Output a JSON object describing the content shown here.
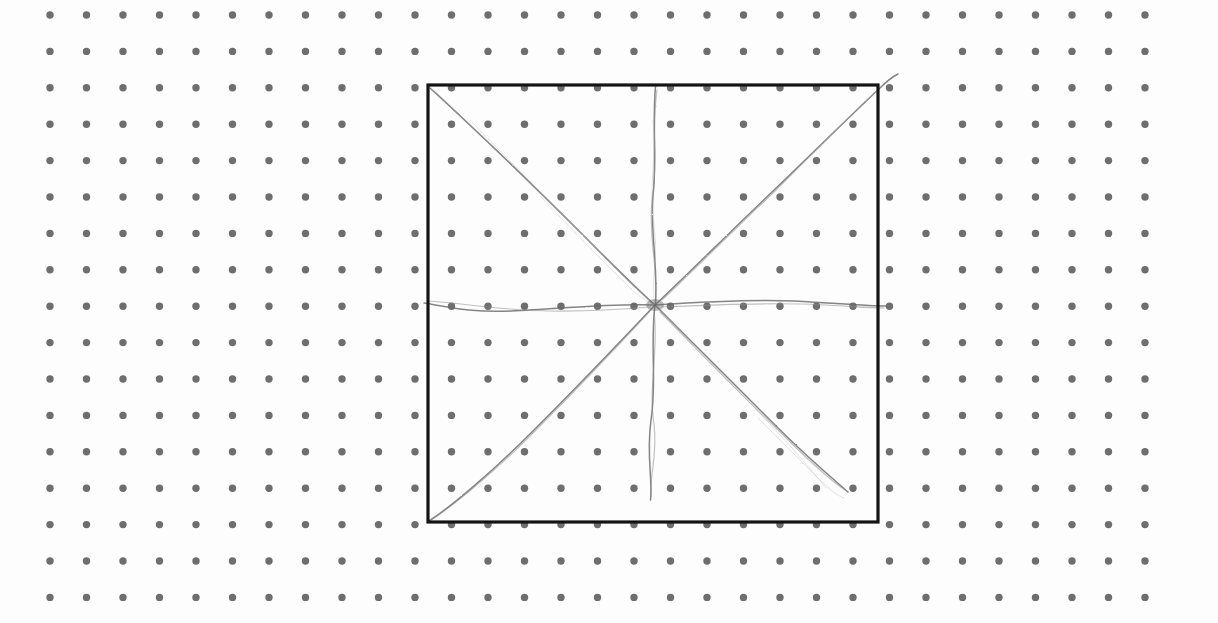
{
  "canvas": {
    "width": 1218,
    "height": 623,
    "background_color": "#fdfdfd",
    "description": "Hand-drawn radial starburst sketch on a dotted grid paper background enclosed by a black square frame"
  },
  "dot_grid": {
    "name": "dotted-grid-paper",
    "dot_color": "#6e6e6e",
    "dot_radius": 3.7,
    "origin_x": 50,
    "origin_y": 15,
    "spacing_x": 36.5,
    "spacing_y": 36.4,
    "columns": 31,
    "rows": 17
  },
  "frame": {
    "name": "square-frame",
    "stroke_color": "#141414",
    "stroke_width": 3.2,
    "left": 428,
    "top": 85,
    "right": 878,
    "bottom": 522,
    "width": 450,
    "height": 437
  },
  "sketch": {
    "name": "radial-starburst",
    "center_x": 655,
    "center_y": 305,
    "stroke_color": "#8c8c8c",
    "stroke_color_light": "#b4b4b4",
    "stroke_color_dark": "#6a6a6a",
    "ray_count": 8,
    "rays": [
      {
        "name": "ray-up",
        "direction": "up",
        "angle_deg": 270,
        "end_x": 655,
        "end_y": 86,
        "reaches_edge": true,
        "overshoot": false,
        "passes": 3,
        "paths": [
          "M655.5 86 C 652 130, 657 160, 653 196 C 650 232, 658 262, 655.5 305",
          "M657 90 C 651 132, 659 158, 652 200 C 648 240, 659 268, 655 305",
          "M653 120 C 657 156, 648 188, 654 226 C 659 262, 650 280, 655 304"
        ]
      },
      {
        "name": "ray-down",
        "direction": "down",
        "angle_deg": 90,
        "end_x": 651,
        "end_y": 500,
        "reaches_edge": false,
        "overshoot": false,
        "passes": 2,
        "paths": [
          "M655 305 C 650 345, 657 382, 651 420 C 646 456, 653 480, 650.5 500",
          "M654 312 C 659 350, 648 388, 654 424 C 658 454, 649 478, 651 496"
        ]
      },
      {
        "name": "ray-left",
        "direction": "left",
        "angle_deg": 180,
        "end_x": 424,
        "end_y": 303,
        "reaches_edge": true,
        "overshoot": true,
        "passes": 2,
        "paths": [
          "M655 305 C 610 303, 560 309, 512 311 C 470 313, 444 306, 424 303",
          "M650 307 C 604 311, 556 313, 510 309 C 474 306, 448 302, 428 301"
        ]
      },
      {
        "name": "ray-right",
        "direction": "right",
        "angle_deg": 0,
        "end_x": 886,
        "end_y": 306,
        "reaches_edge": true,
        "overshoot": true,
        "passes": 2,
        "paths": [
          "M655 305 C 700 302, 748 299, 794 301 C 836 303, 864 306, 886 306",
          "M662 307 C 706 305, 752 303, 800 304 C 840 305, 866 308, 884 308"
        ]
      },
      {
        "name": "ray-up-left",
        "direction": "up-left",
        "angle_deg": 225,
        "end_x": 430,
        "end_y": 88,
        "reaches_edge": true,
        "overshoot": false,
        "passes": 4,
        "paths": [
          "M430 88 C 478 132, 532 184, 582 234 C 618 270, 640 292, 655 305",
          "M434 91 C 484 138, 538 190, 588 240 C 620 274, 642 294, 654 305",
          "M470 120 C 512 164, 556 208, 598 250 C 624 278, 644 296, 655 306",
          "M540 196 C 572 230, 606 264, 632 290 C 644 300, 650 303, 655 305"
        ]
      },
      {
        "name": "ray-down-right",
        "direction": "down-right",
        "angle_deg": 45,
        "end_x": 848,
        "end_y": 492,
        "reaches_edge": false,
        "overshoot": false,
        "passes": 4,
        "paths": [
          "M655 305 C 692 342, 734 384, 776 426 C 808 458, 832 478, 848 492",
          "M660 312 C 696 348, 736 390, 778 430 C 806 458, 830 480, 845 490",
          "M710 362 C 742 394, 770 424, 792 448 C 806 464, 818 478, 826 488",
          "M758 418 C 782 442, 804 464, 820 480 C 830 490, 838 496, 844 498"
        ]
      },
      {
        "name": "ray-down-left",
        "direction": "down-left",
        "angle_deg": 135,
        "end_x": 429,
        "end_y": 521,
        "reaches_edge": true,
        "overshoot": false,
        "passes": 2,
        "paths": [
          "M655 305 C 620 342, 578 386, 534 430 C 492 472, 452 506, 429 521",
          "M650 311 C 616 348, 574 392, 530 436 C 490 476, 450 508, 431 520"
        ]
      },
      {
        "name": "ray-up-right",
        "direction": "up-right",
        "angle_deg": 315,
        "end_x": 898,
        "end_y": 74,
        "reaches_edge": true,
        "overshoot": true,
        "passes": 3,
        "paths": [
          "M655 305 C 690 272, 730 232, 772 192 C 814 152, 858 108, 880 88 C 888 80, 894 76, 898 74",
          "M662 300 C 696 268, 734 230, 776 190 C 816 150, 856 110, 878 90",
          "M760 206 C 790 176, 818 148, 840 126 C 856 110, 868 98, 876 92"
        ]
      }
    ]
  }
}
